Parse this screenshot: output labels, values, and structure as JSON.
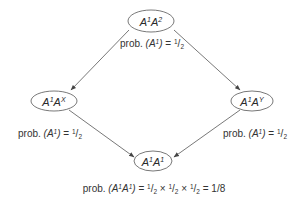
{
  "diagram": {
    "colors": {
      "line": "#555555",
      "text": "#333333",
      "background": "#ffffff"
    },
    "nodes": {
      "top": {
        "base1": "A",
        "sup1": "1",
        "base2": "A",
        "sup2": "2"
      },
      "left": {
        "base1": "A",
        "sup1": "1",
        "base2": "A",
        "sup2": "X"
      },
      "right": {
        "base1": "A",
        "sup1": "1",
        "base2": "A",
        "sup2": "Y"
      },
      "bottom": {
        "base1": "A",
        "sup1": "1",
        "base2": "A",
        "sup2": "1"
      }
    },
    "edge_labels": {
      "top": {
        "prefix": "prob. ",
        "open": "(",
        "var": "A",
        "var_sup": "1",
        "close": ")",
        "eq": " = ",
        "num": "1",
        "slash": "/",
        "den": "2"
      },
      "left": {
        "prefix": "prob. ",
        "open": "(",
        "var": "A",
        "var_sup": "1",
        "close": ")",
        "eq": " = ",
        "num": "1",
        "slash": "/",
        "den": "2"
      },
      "right": {
        "prefix": "prob. ",
        "open": "(",
        "var": "A",
        "var_sup": "1",
        "close": ")",
        "eq": " = ",
        "num": "1",
        "slash": "/",
        "den": "2"
      }
    },
    "result_label": {
      "prefix": "prob. ",
      "open": "(",
      "var1": "A",
      "var1_sup": "1",
      "var2": "A",
      "var2_sup": "1",
      "close": ")",
      "eq": " = ",
      "f1_num": "1",
      "f1_slash": "/",
      "f1_den": "2",
      "times1": " × ",
      "f2_num": "1",
      "f2_slash": "/",
      "f2_den": "2",
      "times2": " × ",
      "f3_num": "1",
      "f3_slash": "/",
      "f3_den": "2",
      "eq2": " = ",
      "result": "1/8"
    }
  }
}
